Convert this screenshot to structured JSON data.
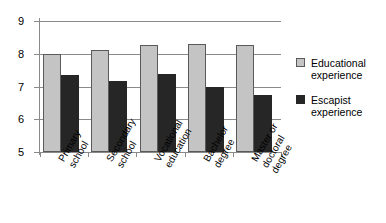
{
  "chart_data": {
    "type": "bar",
    "title": "",
    "xlabel": "",
    "ylabel": "",
    "ylim": [
      5,
      9
    ],
    "yticks": [
      5,
      6,
      7,
      8,
      9
    ],
    "grid": true,
    "legend_position": "right",
    "categories": [
      "Primary school",
      "Secondary school",
      "Vocational education",
      "Bachelor degree",
      "Master or doctoral degree"
    ],
    "category_lines": [
      [
        "Primary",
        "school"
      ],
      [
        "Secondary",
        "school"
      ],
      [
        "Vocational",
        "education"
      ],
      [
        "Bachelor",
        "degree"
      ],
      [
        "Master or",
        "doctoral",
        "degree"
      ]
    ],
    "series": [
      {
        "name": "Educational experience",
        "name_lines": [
          "Educational",
          "experience"
        ],
        "color": "#c4c4c4",
        "values": [
          8.0,
          8.12,
          8.28,
          8.3,
          8.27
        ]
      },
      {
        "name": "Escapist experience",
        "name_lines": [
          "Escapist",
          "experience"
        ],
        "color": "#262626",
        "values": [
          7.36,
          7.18,
          7.38,
          6.97,
          6.74
        ]
      }
    ]
  },
  "axis": {
    "y_tick_labels": [
      "5",
      "6",
      "7",
      "8",
      "9"
    ]
  }
}
